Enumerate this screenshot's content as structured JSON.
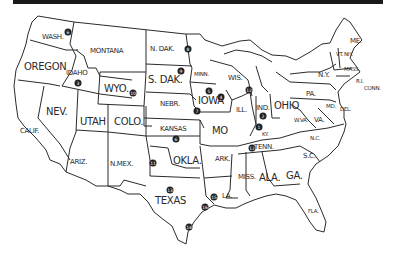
{
  "map": {
    "title_bar": "",
    "states": [
      {
        "id": "wash",
        "label": "WASH.",
        "x": 42,
        "y": 34,
        "size": "sm"
      },
      {
        "id": "oregon",
        "label": "OREGON",
        "x": 24,
        "y": 62,
        "size": ""
      },
      {
        "id": "idaho",
        "label": "IDAHO",
        "x": 66,
        "y": 70,
        "size": "sm"
      },
      {
        "id": "montana",
        "label": "MONTANA",
        "x": 90,
        "y": 48,
        "size": "sm"
      },
      {
        "id": "wyo",
        "label": "WYO.",
        "x": 104,
        "y": 84,
        "size": ""
      },
      {
        "id": "n-dak",
        "label": "N. DAK.",
        "x": 150,
        "y": 46,
        "size": "sm"
      },
      {
        "id": "s-dak",
        "label": "S. DAK.",
        "x": 148,
        "y": 75,
        "size": ""
      },
      {
        "id": "nebr",
        "label": "NEBR.",
        "x": 160,
        "y": 101,
        "size": "sm"
      },
      {
        "id": "minn",
        "label": "MINN.",
        "x": 194,
        "y": 72,
        "size": "xs"
      },
      {
        "id": "iowa",
        "label": "IOWA",
        "x": 198,
        "y": 96,
        "size": ""
      },
      {
        "id": "wis",
        "label": "WIS.",
        "x": 228,
        "y": 75,
        "size": "sm"
      },
      {
        "id": "nev",
        "label": "NEV.",
        "x": 46,
        "y": 107,
        "size": ""
      },
      {
        "id": "utah",
        "label": "UTAH",
        "x": 80,
        "y": 117,
        "size": ""
      },
      {
        "id": "colo",
        "label": "COLO.",
        "x": 114,
        "y": 117,
        "size": ""
      },
      {
        "id": "calif",
        "label": "CALIF.",
        "x": 20,
        "y": 128,
        "size": "sm"
      },
      {
        "id": "kansas",
        "label": "KANSAS",
        "x": 160,
        "y": 126,
        "size": "sm"
      },
      {
        "id": "mo",
        "label": "MO",
        "x": 212,
        "y": 126,
        "size": ""
      },
      {
        "id": "ill",
        "label": "ILL.",
        "x": 236,
        "y": 107,
        "size": "sm"
      },
      {
        "id": "ind",
        "label": "IND.",
        "x": 256,
        "y": 105,
        "size": "sm"
      },
      {
        "id": "ohio",
        "label": "OHIO",
        "x": 274,
        "y": 101,
        "size": ""
      },
      {
        "id": "pa",
        "label": "PA.",
        "x": 306,
        "y": 91,
        "size": "sm"
      },
      {
        "id": "ny",
        "label": "N.Y.",
        "x": 318,
        "y": 72,
        "size": "sm"
      },
      {
        "id": "me",
        "label": "ME.",
        "x": 350,
        "y": 38,
        "size": "sm"
      },
      {
        "id": "vt",
        "label": "VT.",
        "x": 336,
        "y": 52,
        "size": "xs"
      },
      {
        "id": "nh",
        "label": "NH.",
        "x": 344,
        "y": 52,
        "size": "xs"
      },
      {
        "id": "mass",
        "label": "MASS.",
        "x": 344,
        "y": 67,
        "size": "xs"
      },
      {
        "id": "ri",
        "label": "R.I.",
        "x": 356,
        "y": 79,
        "size": "xs"
      },
      {
        "id": "conn",
        "label": "CONN.",
        "x": 364,
        "y": 86,
        "size": "xs"
      },
      {
        "id": "md",
        "label": "MD.",
        "x": 326,
        "y": 104,
        "size": "xs"
      },
      {
        "id": "del",
        "label": "DEL.",
        "x": 340,
        "y": 107,
        "size": "xs"
      },
      {
        "id": "wva",
        "label": "W.VA.",
        "x": 294,
        "y": 118,
        "size": "xs"
      },
      {
        "id": "va",
        "label": "VA.",
        "x": 314,
        "y": 117,
        "size": "sm"
      },
      {
        "id": "ky",
        "label": "KY.",
        "x": 262,
        "y": 132,
        "size": "xs"
      },
      {
        "id": "tenn",
        "label": "TENN.",
        "x": 254,
        "y": 144,
        "size": "sm"
      },
      {
        "id": "nc",
        "label": "N.C.",
        "x": 310,
        "y": 136,
        "size": "xs"
      },
      {
        "id": "sc",
        "label": "S.C.",
        "x": 303,
        "y": 153,
        "size": "sm"
      },
      {
        "id": "ariz",
        "label": "ARIZ.",
        "x": 70,
        "y": 159,
        "size": "sm"
      },
      {
        "id": "n-mex",
        "label": "N.MEX.",
        "x": 110,
        "y": 161,
        "size": "sm"
      },
      {
        "id": "okla",
        "label": "OKLA.",
        "x": 173,
        "y": 156,
        "size": ""
      },
      {
        "id": "ark",
        "label": "ARK.",
        "x": 215,
        "y": 156,
        "size": "sm"
      },
      {
        "id": "miss",
        "label": "MISS.",
        "x": 238,
        "y": 174,
        "size": "sm"
      },
      {
        "id": "ala",
        "label": "ALA.",
        "x": 259,
        "y": 173,
        "size": ""
      },
      {
        "id": "ga",
        "label": "GA.",
        "x": 286,
        "y": 171,
        "size": ""
      },
      {
        "id": "texas",
        "label": "TEXAS",
        "x": 155,
        "y": 196,
        "size": ""
      },
      {
        "id": "la",
        "label": "LA.",
        "x": 222,
        "y": 193,
        "size": "sm"
      },
      {
        "id": "fla",
        "label": "FLA.",
        "x": 308,
        "y": 209,
        "size": "xs"
      }
    ],
    "markers": [
      {
        "n": "6",
        "x": 68,
        "y": 32
      },
      {
        "n": "3",
        "x": 78,
        "y": 83
      },
      {
        "n": "10",
        "x": 133,
        "y": 93
      },
      {
        "n": "8",
        "x": 188,
        "y": 49
      },
      {
        "n": "9",
        "x": 181,
        "y": 71
      },
      {
        "n": "7",
        "x": 197,
        "y": 111
      },
      {
        "n": "5",
        "x": 209,
        "y": 91
      },
      {
        "n": "4",
        "x": 221,
        "y": 97
      },
      {
        "n": "12",
        "x": 249,
        "y": 90
      },
      {
        "n": "2",
        "x": 263,
        "y": 116
      },
      {
        "n": "1",
        "x": 259,
        "y": 127
      },
      {
        "n": "12",
        "x": 252,
        "y": 148
      },
      {
        "n": "6",
        "x": 176,
        "y": 139
      },
      {
        "n": "11",
        "x": 153,
        "y": 163
      },
      {
        "n": "13",
        "x": 170,
        "y": 190
      },
      {
        "n": "15",
        "x": 214,
        "y": 197
      },
      {
        "n": "16",
        "x": 205,
        "y": 207
      },
      {
        "n": "14",
        "x": 189,
        "y": 227
      }
    ]
  }
}
